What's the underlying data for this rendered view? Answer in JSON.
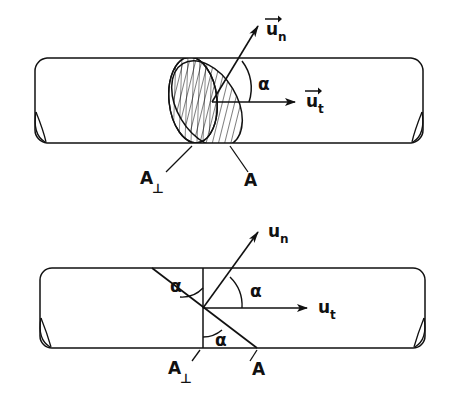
{
  "figure": {
    "type": "technical-diagram",
    "background_color": "#ffffff",
    "line_color": "#111111",
    "panels": [
      {
        "id": "upper",
        "name": "perspective-view",
        "description": "Three-dimensional perspective of a cylinder intersected by an inclined elliptical section",
        "cylinder": {
          "left": 35,
          "right": 423,
          "top": 58,
          "bottom": 143,
          "axis_y": 102
        },
        "sections": [
          {
            "name": "perpendicular-section",
            "label": "A",
            "subscript": "⊥",
            "hatch_style": "vertical",
            "orientation_deg": 0
          },
          {
            "name": "oblique-section",
            "label": "A",
            "subscript": "",
            "hatch_style": "diagonal",
            "orientation_deg": -32
          }
        ],
        "vectors": [
          {
            "name": "normal-unit-vector",
            "label": "u",
            "subscript": "n",
            "overbar": "arrow",
            "direction_deg": 58,
            "label_text": "u⃗n"
          },
          {
            "name": "tangential-unit-vector",
            "label": "u",
            "subscript": "t",
            "overbar": "arrow",
            "direction_deg": 0,
            "label_text": "u⃗t"
          }
        ],
        "angles": [
          {
            "name": "alpha-between-un-and-ut",
            "label": "α",
            "x": 262,
            "y": 84
          }
        ],
        "leaders": [
          {
            "name": "leader-to-perpendicular-section",
            "label": "A",
            "subscript": "⊥"
          },
          {
            "name": "leader-to-oblique-section",
            "label": "A",
            "subscript": ""
          }
        ]
      },
      {
        "id": "lower",
        "name": "side-view",
        "description": "Flat side projection of the same cylinder showing the three equal alpha angles",
        "cylinder": {
          "left": 40,
          "right": 425,
          "top": 268,
          "bottom": 348,
          "axis_y": 308
        },
        "sections": [
          {
            "name": "perpendicular-section-line",
            "label": "A",
            "subscript": "⊥",
            "orientation": "vertical",
            "x": 203
          },
          {
            "name": "oblique-section-line",
            "label": "A",
            "subscript": "",
            "orientation": "oblique",
            "from_x": 152,
            "to_x": 257
          }
        ],
        "vectors": [
          {
            "name": "normal-unit-vector",
            "label": "u",
            "subscript": "n",
            "overbar": "none",
            "direction_deg": 58,
            "label_text": "un"
          },
          {
            "name": "tangential-unit-vector",
            "label": "u",
            "subscript": "t",
            "overbar": "none",
            "direction_deg": 0,
            "label_text": "ut"
          }
        ],
        "angles": [
          {
            "name": "alpha-upper-left",
            "label": "α",
            "x": 178,
            "y": 285
          },
          {
            "name": "alpha-upper-right",
            "label": "α",
            "x": 243,
            "y": 291
          },
          {
            "name": "alpha-lower",
            "label": "α",
            "x": 224,
            "y": 340
          }
        ],
        "leaders": [
          {
            "name": "leader-to-perpendicular-section",
            "label": "A",
            "subscript": "⊥"
          },
          {
            "name": "leader-to-oblique-section",
            "label": "A",
            "subscript": ""
          }
        ]
      }
    ],
    "labels": {
      "u_n_vector": "u",
      "u_n_sub": "n",
      "u_t_vector": "u",
      "u_t_sub": "t",
      "alpha": "α",
      "area_A": "A",
      "perp_symbol": "⊥"
    }
  }
}
